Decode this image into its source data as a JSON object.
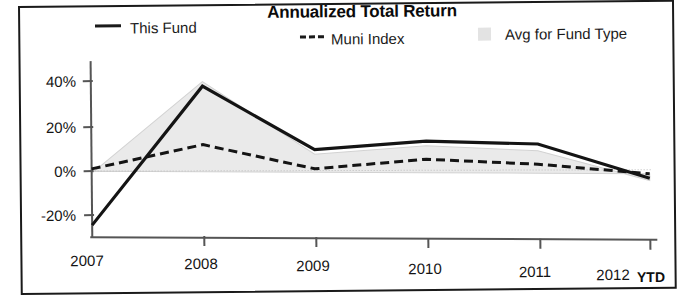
{
  "chart_data": {
    "type": "area",
    "title": "Annualized Total Return",
    "xlabel": "",
    "ylabel": "",
    "categories": [
      "2007",
      "2008",
      "2009",
      "2010",
      "2011",
      "2012"
    ],
    "x_axis_note": "YTD",
    "ylim": [
      -30,
      45
    ],
    "yticks": [
      "40%",
      "20%",
      "0%",
      "-20%"
    ],
    "ytick_values": [
      40,
      20,
      0,
      -20
    ],
    "grid": false,
    "legend_position": "top",
    "series": [
      {
        "name": "This Fund",
        "style": "solid-line",
        "color": "#1a1a1a",
        "values": [
          -24,
          38,
          10,
          14,
          13,
          -2
        ]
      },
      {
        "name": "Muni Index",
        "style": "dashed-line",
        "color": "#1a1a1a",
        "values": [
          1,
          12,
          1.5,
          6,
          4,
          0
        ]
      },
      {
        "name": "Avg for Fund Type",
        "style": "filled-area",
        "color": "#e8e8e8",
        "values": [
          -1,
          40,
          8,
          12,
          10,
          -3
        ]
      }
    ]
  },
  "chart": {
    "title": "Annualized Total Return",
    "legend": [
      {
        "label": "This Fund",
        "marker": "solid-line-swatch"
      },
      {
        "label": "Muni Index",
        "marker": "dashed-line-swatch"
      },
      {
        "label": "Avg for Fund Type",
        "marker": "gray-square-swatch"
      }
    ],
    "y_axis": {
      "ticks": [
        "40%",
        "20%",
        "0%",
        "-20%"
      ]
    },
    "x_axis": {
      "ticks": [
        "2007",
        "2008",
        "2009",
        "2010",
        "2011",
        "2012"
      ],
      "suffix": "YTD"
    },
    "colors": {
      "line": "#1a1a1a",
      "area_fill": "#e8e8e8",
      "axis": "#555555",
      "frame": "#1a1a1a"
    }
  }
}
